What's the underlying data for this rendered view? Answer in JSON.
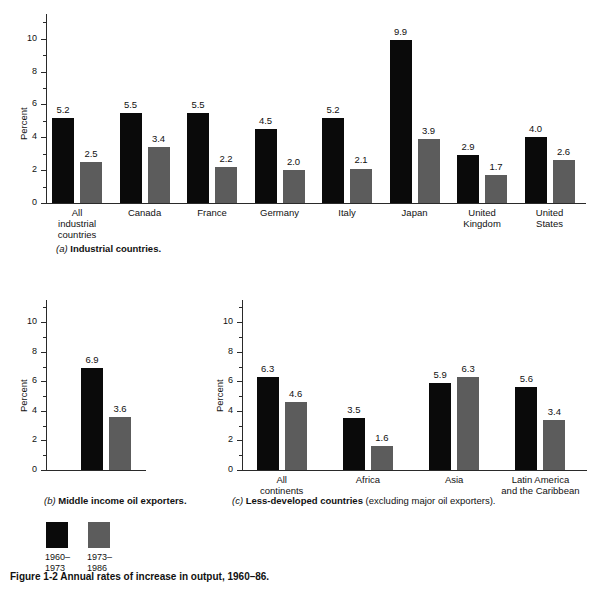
{
  "figure": {
    "caption": "Figure 1-2   Annual rates of increase in output, 1960–86."
  },
  "legend": {
    "series": [
      {
        "label": "1960–\n1973",
        "color": "#0a0a0a"
      },
      {
        "label": "1973–\n1986",
        "color": "#5c5c5c"
      }
    ]
  },
  "panels": {
    "a": {
      "tag": "(a)",
      "title": "Industrial countries.",
      "note": "",
      "ylabel": "Percent",
      "yticks": [
        "0",
        "2",
        "4",
        "6",
        "8",
        "10"
      ]
    },
    "b": {
      "tag": "(b)",
      "title": "Middle income oil exporters.",
      "note": "",
      "ylabel": "Percent",
      "yticks": [
        "0",
        "2",
        "4",
        "6",
        "8",
        "10"
      ]
    },
    "c": {
      "tag": "(c)",
      "title": "Less-developed countries",
      "note": " (excluding major oil exporters).",
      "ylabel": "Percent",
      "yticks": [
        "0",
        "2",
        "4",
        "6",
        "8",
        "10"
      ]
    }
  },
  "chart_data": [
    {
      "id": "a",
      "type": "bar",
      "title": "(a) Industrial countries.",
      "xlabel": "",
      "ylabel": "Percent",
      "ylim": [
        0,
        11.5
      ],
      "yticks": [
        0,
        2,
        4,
        6,
        8,
        10
      ],
      "grid": false,
      "legend_position": "below-figure",
      "categories": [
        "All\nindustrial\ncountries",
        "Canada",
        "France",
        "Germany",
        "Italy",
        "Japan",
        "United\nKingdom",
        "United\nStates"
      ],
      "series": [
        {
          "name": "1960–1973",
          "color": "#0a0a0a",
          "values": [
            5.2,
            5.5,
            5.5,
            4.5,
            5.2,
            9.9,
            2.9,
            4.0
          ]
        },
        {
          "name": "1973–1986",
          "color": "#5c5c5c",
          "values": [
            2.5,
            3.4,
            2.2,
            2.0,
            2.1,
            3.9,
            1.7,
            2.6
          ]
        }
      ]
    },
    {
      "id": "b",
      "type": "bar",
      "title": "(b) Middle income oil exporters.",
      "xlabel": "",
      "ylabel": "Percent",
      "ylim": [
        0,
        11.5
      ],
      "yticks": [
        0,
        2,
        4,
        6,
        8,
        10
      ],
      "grid": false,
      "legend_position": "below-figure",
      "categories": [
        ""
      ],
      "series": [
        {
          "name": "1960–1973",
          "color": "#0a0a0a",
          "values": [
            6.9
          ]
        },
        {
          "name": "1973–1986",
          "color": "#5c5c5c",
          "values": [
            3.6
          ]
        }
      ]
    },
    {
      "id": "c",
      "type": "bar",
      "title": "(c) Less-developed countries (excluding major oil exporters).",
      "xlabel": "",
      "ylabel": "Percent",
      "ylim": [
        0,
        11.5
      ],
      "yticks": [
        0,
        2,
        4,
        6,
        8,
        10
      ],
      "grid": false,
      "legend_position": "below-figure",
      "categories": [
        "All\ncontinents",
        "Africa",
        "Asia",
        "Latin America\nand the Caribbean"
      ],
      "series": [
        {
          "name": "1960–1973",
          "color": "#0a0a0a",
          "values": [
            6.3,
            3.5,
            5.9,
            5.6
          ]
        },
        {
          "name": "1973–1986",
          "color": "#5c5c5c",
          "values": [
            4.6,
            1.6,
            6.3,
            3.4
          ]
        }
      ]
    }
  ]
}
